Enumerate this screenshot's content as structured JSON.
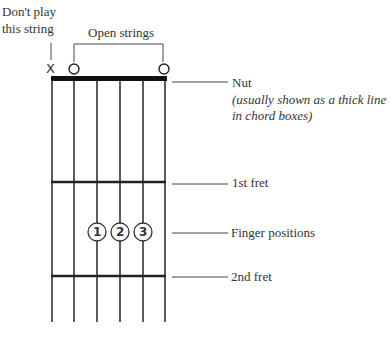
{
  "diagram": {
    "labels": {
      "dont_play_line1": "Don't play",
      "dont_play_line2": "this string",
      "open_strings": "Open strings",
      "nut": "Nut",
      "nut_note_line1": "(usually shown as a thick line",
      "nut_note_line2": "in chord boxes)",
      "first_fret": "1st fret",
      "finger_positions": "Finger positions",
      "second_fret": "2nd fret"
    },
    "string_markers": [
      "X",
      "O",
      "",
      "",
      "",
      "O"
    ],
    "fingers": [
      {
        "string": 2,
        "number": "1"
      },
      {
        "string": 3,
        "number": "2"
      },
      {
        "string": 4,
        "number": "3"
      }
    ],
    "strings": 6,
    "frets_shown": 2
  }
}
